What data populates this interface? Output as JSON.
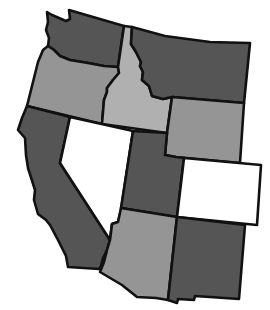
{
  "map": {
    "title": "Western United States",
    "colors": {
      "dark": "#555555",
      "light": "#959595",
      "white": "#ffffff",
      "border": "#111111"
    },
    "states": [
      {
        "id": "washington",
        "name": "Washington",
        "shade": "dark"
      },
      {
        "id": "oregon",
        "name": "Oregon",
        "shade": "light"
      },
      {
        "id": "idaho",
        "name": "Idaho",
        "shade": "lighter"
      },
      {
        "id": "montana",
        "name": "Montana",
        "shade": "dark"
      },
      {
        "id": "wyoming",
        "name": "Wyoming",
        "shade": "light"
      },
      {
        "id": "california",
        "name": "California",
        "shade": "dark"
      },
      {
        "id": "nevada",
        "name": "Nevada",
        "shade": "white"
      },
      {
        "id": "utah",
        "name": "Utah",
        "shade": "dark"
      },
      {
        "id": "colorado",
        "name": "Colorado",
        "shade": "white"
      },
      {
        "id": "arizona",
        "name": "Arizona",
        "shade": "light"
      },
      {
        "id": "new-mexico",
        "name": "New Mexico",
        "shade": "dark"
      }
    ]
  }
}
